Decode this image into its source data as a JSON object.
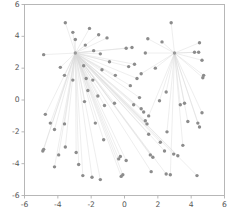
{
  "chart_data": {
    "type": "scatter",
    "title": "",
    "subtitle": "",
    "xlabel": "",
    "ylabel": "",
    "xlim": [
      -6,
      6
    ],
    "ylim": [
      -6,
      6
    ],
    "xticks": [
      -6,
      -4,
      -2,
      0,
      2,
      4,
      6
    ],
    "yticks": [
      -6,
      -4,
      -2,
      0,
      2,
      4,
      6
    ],
    "xticklabels": [
      "-6",
      "-4",
      "-2",
      "0",
      "2",
      "4",
      "6"
    ],
    "yticklabels": [
      "-6",
      "-4",
      "-2",
      "0",
      "2",
      "4",
      "6"
    ],
    "grid": false,
    "legend": null,
    "legend_position": "none",
    "marker_color": "#8c8c8c",
    "line_color": "#d9d9d9",
    "axis_color": "#b0b0b0",
    "tick_label_color": "#555555",
    "background_color": "#ffffff",
    "centers": [
      {
        "name": "cluster-1-center",
        "x": -2.95,
        "y": 2.95
      },
      {
        "name": "cluster-2-center",
        "x": 3.0,
        "y": 2.95
      }
    ],
    "series": [
      {
        "name": "cluster-1",
        "center": [
          -2.95,
          2.95
        ],
        "points": [
          [
            -3.55,
            4.85
          ],
          [
            -3.1,
            4.25
          ],
          [
            -2.95,
            3.8
          ],
          [
            -2.1,
            4.5
          ],
          [
            -1.55,
            4.1
          ],
          [
            -1.05,
            3.9
          ],
          [
            -2.35,
            3.45
          ],
          [
            -1.85,
            3.1
          ],
          [
            -4.85,
            2.85
          ],
          [
            -3.85,
            2.05
          ],
          [
            -3.6,
            1.55
          ],
          [
            -3.1,
            1.25
          ],
          [
            -2.45,
            2.15
          ],
          [
            -2.3,
            1.35
          ],
          [
            -1.9,
            1.25
          ],
          [
            -1.45,
            2.9
          ],
          [
            -2.2,
            0.6
          ],
          [
            -1.6,
            0.25
          ],
          [
            -2.4,
            -0.1
          ],
          [
            -1.2,
            -0.35
          ],
          [
            -0.6,
            -0.2
          ],
          [
            -4.75,
            -0.9
          ],
          [
            -4.45,
            -1.45
          ],
          [
            -4.2,
            -1.85
          ],
          [
            -3.6,
            -1.5
          ],
          [
            -1.75,
            -1.45
          ],
          [
            -1.25,
            -2.5
          ],
          [
            -4.9,
            -3.2
          ],
          [
            -4.85,
            -3.1
          ],
          [
            -4.2,
            -4.2
          ],
          [
            -3.95,
            -3.45
          ],
          [
            -3.55,
            -2.95
          ],
          [
            -2.9,
            -3.3
          ],
          [
            -2.75,
            -4.05
          ],
          [
            -2.5,
            -4.75
          ],
          [
            -1.95,
            -4.85
          ],
          [
            -1.45,
            -5.0
          ],
          [
            -0.35,
            -3.7
          ],
          [
            -0.25,
            -3.55
          ],
          [
            0.1,
            -3.8
          ],
          [
            -0.2,
            -4.8
          ],
          [
            -0.1,
            -4.7
          ],
          [
            0.55,
            -0.3
          ],
          [
            0.35,
            0.9
          ],
          [
            0.25,
            2.1
          ],
          [
            0.1,
            3.25
          ],
          [
            0.45,
            3.3
          ],
          [
            0.6,
            2.25
          ],
          [
            0.75,
            1.35
          ],
          [
            1.0,
            -0.55
          ],
          [
            1.25,
            -1.3
          ],
          [
            1.35,
            -1.5
          ],
          [
            1.45,
            -2.15
          ],
          [
            1.55,
            -3.45
          ],
          [
            1.7,
            -3.6
          ],
          [
            1.6,
            -4.5
          ],
          [
            2.15,
            -2.65
          ],
          [
            2.4,
            -3.2
          ],
          [
            2.5,
            -4.65
          ],
          [
            2.95,
            -3.4
          ],
          [
            3.2,
            -3.5
          ],
          [
            4.35,
            -4.75
          ],
          [
            -0.55,
            1.55
          ],
          [
            -0.9,
            2.4
          ],
          [
            -1.35,
            1.9
          ],
          [
            0.9,
            0.15
          ],
          [
            1.15,
            -0.75
          ]
        ]
      },
      {
        "name": "cluster-2",
        "center": [
          3.0,
          2.95
        ],
        "points": [
          [
            2.8,
            4.85
          ],
          [
            1.4,
            3.85
          ],
          [
            2.25,
            3.65
          ],
          [
            4.5,
            3.6
          ],
          [
            4.2,
            3.0
          ],
          [
            4.45,
            3.0
          ],
          [
            4.65,
            2.5
          ],
          [
            1.25,
            2.95
          ],
          [
            1.0,
            1.65
          ],
          [
            1.85,
            2.0
          ],
          [
            2.5,
            0.5
          ],
          [
            3.35,
            -0.3
          ],
          [
            3.6,
            -0.2
          ],
          [
            4.75,
            1.55
          ],
          [
            4.7,
            1.4
          ],
          [
            4.65,
            -0.8
          ],
          [
            4.4,
            -1.45
          ],
          [
            4.5,
            -1.7
          ],
          [
            3.8,
            -1.35
          ],
          [
            2.55,
            -2.0
          ],
          [
            2.75,
            -4.7
          ],
          [
            3.5,
            -2.85
          ],
          [
            1.45,
            -1.0
          ],
          [
            2.1,
            -0.05
          ]
        ]
      }
    ],
    "n_points": 91,
    "n_clusters": 2
  }
}
